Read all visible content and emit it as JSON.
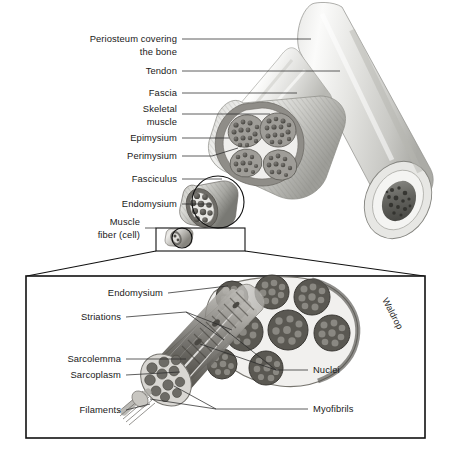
{
  "figure": {
    "signature": "Waldrop",
    "background_color": "#ffffff",
    "ink_color": "#1a1a1a"
  },
  "upper_labels": [
    {
      "id": "periosteum",
      "line1": "Periosteum covering",
      "line2": "the bone"
    },
    {
      "id": "tendon",
      "line1": "Tendon",
      "line2": ""
    },
    {
      "id": "fascia",
      "line1": "Fascia",
      "line2": ""
    },
    {
      "id": "skeletal-muscle",
      "line1": "Skeletal",
      "line2": "muscle"
    },
    {
      "id": "epimysium",
      "line1": "Epimysium",
      "line2": ""
    },
    {
      "id": "perimysium",
      "line1": "Perimysium",
      "line2": ""
    },
    {
      "id": "fasciculus",
      "line1": "Fasciculus",
      "line2": ""
    },
    {
      "id": "endomysium",
      "line1": "Endomysium",
      "line2": ""
    },
    {
      "id": "muscle-fiber",
      "line1": "Muscle",
      "line2": "fiber (cell)"
    }
  ],
  "detail_labels_left": [
    {
      "id": "endomysium-detail",
      "text": "Endomysium"
    },
    {
      "id": "striations",
      "text": "Striations"
    },
    {
      "id": "sarcolemma",
      "text": "Sarcolemma"
    },
    {
      "id": "sarcoplasm",
      "text": "Sarcoplasm"
    },
    {
      "id": "filaments",
      "text": "Filaments"
    }
  ],
  "detail_labels_right": [
    {
      "id": "nuclei",
      "text": "Nuclei"
    },
    {
      "id": "myofibrils",
      "text": "Myofibrils"
    }
  ],
  "structures": [
    {
      "id": "bone",
      "description": "long bone shaft with cortical ring and marrow"
    },
    {
      "id": "muscle-belly",
      "description": "skeletal muscle cut end showing fascicles"
    },
    {
      "id": "fasciculus-bundle",
      "description": "single fasciculus with muscle fibers"
    },
    {
      "id": "muscle-fiber-single",
      "description": "single muscle fiber cell"
    },
    {
      "id": "magnified-fiber",
      "description": "enlarged muscle fiber with myofibrils and filaments"
    }
  ]
}
